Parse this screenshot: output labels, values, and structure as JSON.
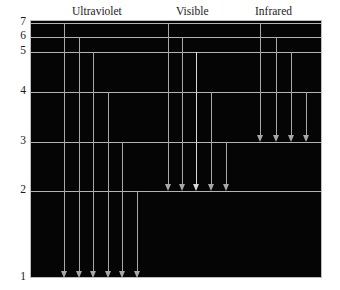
{
  "figure": {
    "title": "",
    "background_color": "#ffffff",
    "plot_color": "#050505",
    "line_color": "#b3b3b3",
    "arrow_color": "#a8a8a8"
  },
  "series_labels": [
    {
      "name": "ultraviolet",
      "text": "Ultraviolet",
      "x": 72,
      "y": 5
    },
    {
      "name": "visible",
      "text": "Visible",
      "x": 176,
      "y": 5
    },
    {
      "name": "infrared",
      "text": "Infrared",
      "x": 255,
      "y": 5
    }
  ],
  "levels": [
    {
      "n": 7,
      "label": "7",
      "y": 22
    },
    {
      "n": 6,
      "label": "6",
      "y": 36
    },
    {
      "n": 5,
      "label": "5",
      "y": 51
    },
    {
      "n": 4,
      "label": "4",
      "y": 91
    },
    {
      "n": 3,
      "label": "3",
      "y": 141
    },
    {
      "n": 2,
      "label": "2",
      "y": 190
    },
    {
      "n": 1,
      "label": "1",
      "y": 277
    }
  ],
  "transitions": [
    {
      "group": "ultraviolet",
      "from": 7,
      "to": 1,
      "x": 63,
      "y_start": 22,
      "y_end": 277,
      "bright": false
    },
    {
      "group": "ultraviolet",
      "from": 6,
      "to": 1,
      "x": 78,
      "y_start": 36,
      "y_end": 277,
      "bright": false
    },
    {
      "group": "ultraviolet",
      "from": 5,
      "to": 1,
      "x": 92,
      "y_start": 51,
      "y_end": 277,
      "bright": false
    },
    {
      "group": "ultraviolet",
      "from": 4,
      "to": 1,
      "x": 107,
      "y_start": 91,
      "y_end": 277,
      "bright": false
    },
    {
      "group": "ultraviolet",
      "from": 3,
      "to": 1,
      "x": 121,
      "y_start": 141,
      "y_end": 277,
      "bright": false
    },
    {
      "group": "ultraviolet",
      "from": 2,
      "to": 1,
      "x": 136,
      "y_start": 190,
      "y_end": 277,
      "bright": false
    },
    {
      "group": "visible",
      "from": 7,
      "to": 2,
      "x": 167,
      "y_start": 22,
      "y_end": 190,
      "bright": false
    },
    {
      "group": "visible",
      "from": 6,
      "to": 2,
      "x": 181,
      "y_start": 36,
      "y_end": 190,
      "bright": false
    },
    {
      "group": "visible",
      "from": 5,
      "to": 2,
      "x": 195,
      "y_start": 51,
      "y_end": 190,
      "bright": true
    },
    {
      "group": "visible",
      "from": 4,
      "to": 2,
      "x": 210,
      "y_start": 91,
      "y_end": 190,
      "bright": false
    },
    {
      "group": "visible",
      "from": 3,
      "to": 2,
      "x": 225,
      "y_start": 141,
      "y_end": 190,
      "bright": false
    },
    {
      "group": "infrared",
      "from": 7,
      "to": 3,
      "x": 259,
      "y_start": 22,
      "y_end": 141,
      "bright": false
    },
    {
      "group": "infrared",
      "from": 6,
      "to": 3,
      "x": 275,
      "y_start": 36,
      "y_end": 141,
      "bright": false
    },
    {
      "group": "infrared",
      "from": 5,
      "to": 3,
      "x": 290,
      "y_start": 51,
      "y_end": 141,
      "bright": false
    },
    {
      "group": "infrared",
      "from": 4,
      "to": 3,
      "x": 305,
      "y_start": 91,
      "y_end": 141,
      "bright": false
    }
  ],
  "chart_data": {
    "type": "diagram",
    "ylabel": "Energy level n",
    "ytick_labels": [
      "1",
      "2",
      "3",
      "4",
      "5",
      "6",
      "7"
    ],
    "yticks": [
      1,
      2,
      3,
      4,
      5,
      6,
      7
    ],
    "ylim": [
      1,
      7
    ],
    "grid": false,
    "legend_position": "top",
    "annotations": [
      "Ultraviolet",
      "Visible",
      "Infrared"
    ],
    "series": [
      {
        "name": "Ultraviolet",
        "final_level": 1,
        "initial_levels": [
          7,
          6,
          5,
          4,
          3,
          2
        ],
        "count": 6
      },
      {
        "name": "Visible",
        "final_level": 2,
        "initial_levels": [
          7,
          6,
          5,
          4,
          3
        ],
        "count": 5
      },
      {
        "name": "Infrared",
        "final_level": 3,
        "initial_levels": [
          7,
          6,
          5,
          4
        ],
        "count": 4
      }
    ]
  }
}
